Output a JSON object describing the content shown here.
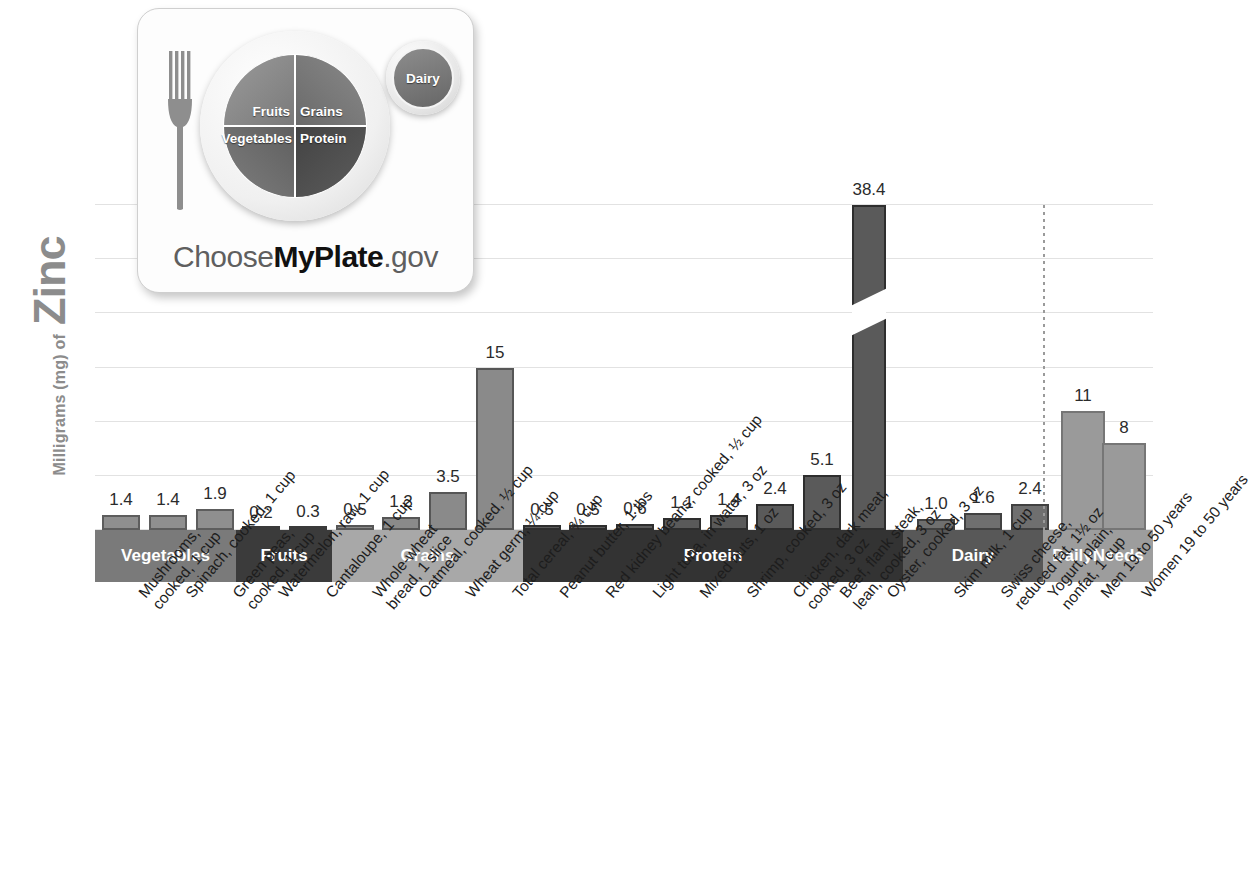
{
  "axis": {
    "y_title_small": "Milligrams (mg) of",
    "y_title_big": "Zinc"
  },
  "logo": {
    "alt": "ChooseMyPlate.gov",
    "plate": {
      "fruits": "Fruits",
      "grains": "Grains",
      "vegetables": "Vegetables",
      "protein": "Protein",
      "dairy": "Dairy"
    },
    "wordmark_pre": "Choose",
    "wordmark_bold": "MyPlate",
    "wordmark_post": ".gov"
  },
  "bands": [
    {
      "label": "Vegetables",
      "color": "#7a7a7a",
      "start": 0,
      "end": 141
    },
    {
      "label": "Fruits",
      "color": "#3b3b3b",
      "start": 141,
      "end": 237
    },
    {
      "label": "Grains",
      "color": "#a8a8a8",
      "start": 237,
      "end": 428
    },
    {
      "label": "Protein",
      "color": "#333333",
      "start": 428,
      "end": 808
    },
    {
      "label": "Dairy",
      "color": "#585858",
      "start": 808,
      "end": 948
    },
    {
      "label": "Daily\nNeeds",
      "color": "#9d9d9d",
      "start": 948,
      "end": 1058
    }
  ],
  "divider_note": "dotted line separating Dairy from Daily Needs",
  "chart_data": {
    "type": "bar",
    "title": "",
    "xlabel": "",
    "ylabel": "Milligrams (mg) of Zinc",
    "ylim": [
      0,
      30
    ],
    "grid": true,
    "gridlines": [
      0,
      5,
      10,
      15,
      20,
      25,
      30
    ],
    "axis_break": {
      "applies_to": "Oyster, cooked, 3 oz",
      "reason": "value exceeds axis range"
    },
    "categories": [
      "Mushrooms, cooked, 1 cup",
      "Spinach, cooked, 1 cup",
      "Green peas, cooked, 1 cup",
      "Watermelon, raw, 1 cup",
      "Cantaloupe, 1 cup",
      "Whole-wheat bread, 1 slice",
      "Oatmeal, cooked, ½ cup",
      "Wheat germ, ¼ cup",
      "Total cereal, ¾ cup",
      "Peanut butter, 1 tbs",
      "Red kidney beans, cooked, ½ cup",
      "Light tuna, in water, 3 oz",
      "Mixed nuts, 1 oz",
      "Shrimp, cooked, 3 oz",
      "Chicken, dark meat, cooked, 3 oz",
      "Beef, flank steak, lean, cooked, 3 oz",
      "Oyster, cooked, 3 oz",
      "Skim milk, 1 cup",
      "Swiss cheese, reduced fat, 1½ oz",
      "Yogurt, plain, nonfat, 1 cup",
      "Men 19 to 50 years",
      "Women 19 to 50 years"
    ],
    "values": [
      1.4,
      1.4,
      1.9,
      0.2,
      0.3,
      0.5,
      1.2,
      3.5,
      15,
      0.5,
      0.5,
      0.6,
      1.1,
      1.4,
      2.4,
      5.1,
      38.4,
      1.0,
      1.6,
      2.4,
      11,
      8
    ],
    "value_labels": [
      "1.4",
      "1.4",
      "1.9",
      "0.2",
      "0.3",
      "0.5",
      "1.2",
      "3.5",
      "15",
      "0.5",
      "0.5",
      "0.6",
      "1.1",
      "1.4",
      "2.4",
      "5.1",
      "38.4",
      "1.0",
      "1.6",
      "2.4",
      "11",
      "8"
    ],
    "groups": [
      "Vegetables",
      "Vegetables",
      "Vegetables",
      "Fruits",
      "Fruits",
      "Grains",
      "Grains",
      "Grains",
      "Grains",
      "Protein",
      "Protein",
      "Protein",
      "Protein",
      "Protein",
      "Protein",
      "Protein",
      "Protein",
      "Dairy",
      "Dairy",
      "Dairy",
      "Daily Needs",
      "Daily Needs"
    ]
  },
  "label_lines": [
    [
      "Mushrooms,",
      "cooked, 1 cup"
    ],
    [
      "Spinach, cooked, 1 cup"
    ],
    [
      "Green peas,",
      "cooked, 1 cup"
    ],
    [
      "Watermelon, raw, 1 cup"
    ],
    [
      "Cantaloupe, 1 cup"
    ],
    [
      "Whole-wheat",
      "bread, 1 slice"
    ],
    [
      "Oatmeal, cooked, ½ cup"
    ],
    [
      "Wheat germ, ¼ cup"
    ],
    [
      "Total cereal, ¾ cup"
    ],
    [
      "Peanut butter, 1 tbs"
    ],
    [
      "Red kidney beans, cooked, ½ cup"
    ],
    [
      "Light tuna, in water, 3 oz"
    ],
    [
      "Mixed nuts, 1 oz"
    ],
    [
      "Shrimp, cooked, 3 oz"
    ],
    [
      "Chicken, dark meat,",
      "cooked, 3 oz"
    ],
    [
      "Beef, flank steak,",
      "lean, cooked, 3 oz"
    ],
    [
      "Oyster, cooked, 3 oz"
    ],
    [
      "Skim milk, 1 cup"
    ],
    [
      "Swiss cheese,",
      "reduced fat, 1½ oz"
    ],
    [
      "Yogurt, plain,",
      "nonfat, 1 cup"
    ],
    [
      "Men 19 to 50 years"
    ],
    [
      "Women 19 to 50 years"
    ]
  ],
  "bar_colors": {
    "vegetables_fill": "#8f8f8f",
    "vegetables_border": "#5d5d5d",
    "fruits_fill": "#6d6d6d",
    "fruits_border": "#3a3a3a",
    "grains_fill": "#8a8a8a",
    "grains_border": "#565656",
    "protein_fill": "#5a5a5a",
    "protein_border": "#2e2e2e",
    "dairy_fill": "#6f6f6f",
    "dairy_border": "#414141",
    "daily_fill": "#9a9a9a",
    "daily_border": "#767676"
  }
}
